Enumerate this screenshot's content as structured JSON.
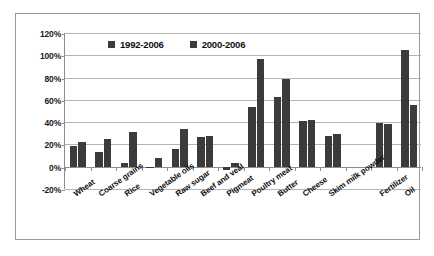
{
  "chart_data": {
    "type": "bar",
    "title": "",
    "subtitle": "",
    "xlabel": "",
    "ylabel": "",
    "ylim": [
      -20,
      120
    ],
    "ytick_labels": [
      "120%",
      "100%",
      "80%",
      "60%",
      "40%",
      "20%",
      "0%",
      "-20%"
    ],
    "ytick_values": [
      120,
      100,
      80,
      60,
      40,
      20,
      0,
      -20
    ],
    "grid": true,
    "legend_position": "top-center",
    "bar_color": "#3b3b3b",
    "categories": [
      "Wheat",
      "Coarse grains",
      "Rice",
      "Vegetable oils",
      "Raw sugar",
      "Beef and veal",
      "Pigmeat",
      "Poultry meat",
      "Butter",
      "Cheese",
      "Skim milk powder",
      "",
      "Fertilizer",
      "Oil"
    ],
    "series": [
      {
        "name": "1992-2006",
        "values": [
          19,
          13,
          3,
          -0.5,
          16,
          27,
          -3,
          54,
          63,
          41,
          28,
          null,
          39,
          105
        ]
      },
      {
        "name": "2000-2006",
        "values": [
          22,
          25,
          31,
          8,
          34,
          28,
          3,
          97,
          79,
          42,
          29.5,
          null,
          38.5,
          55
        ]
      }
    ]
  },
  "legend": {
    "items": [
      {
        "label": "1992-2006",
        "color": "#3b3b3b"
      },
      {
        "label": "2000-2006",
        "color": "#3b3b3b"
      }
    ]
  }
}
